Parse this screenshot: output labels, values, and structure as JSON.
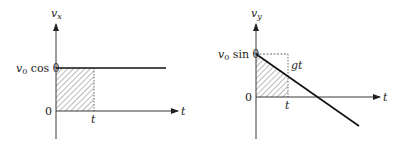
{
  "diagram": {
    "left_graph": {
      "y_axis_label": "v",
      "y_axis_label_sub": "x",
      "x_axis_label": "t",
      "origin_label": "0",
      "level_label_v": "v",
      "level_label_sub": "0",
      "level_label_rest": " cos θ",
      "t_marker_label": "t",
      "description": "Horizontal velocity constant at v0 cos θ; shaded rectangle from 0 to t"
    },
    "right_graph": {
      "y_axis_label": "v",
      "y_axis_label_sub": "y",
      "x_axis_label": "t",
      "origin_label": "0",
      "level_label_v": "v",
      "level_label_sub": "0",
      "level_label_rest": " sin θ",
      "t_marker_label": "t",
      "gt_label": "gt",
      "description": "Vertical velocity decreases linearly from v0 sin θ; shaded trapezoid from 0 to t; drop gt indicated"
    }
  }
}
